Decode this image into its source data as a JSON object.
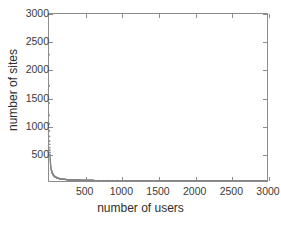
{
  "chart_data": {
    "type": "scatter",
    "title": "",
    "xlabel": "number of users",
    "ylabel": "number of sites",
    "xlim": [
      0,
      3000
    ],
    "ylim": [
      0,
      3000
    ],
    "xticks": [
      500,
      1000,
      1500,
      2000,
      2500,
      3000
    ],
    "yticks": [
      500,
      1000,
      1500,
      2000,
      2500,
      3000
    ],
    "xticklabels": [
      "500",
      "1000",
      "1500",
      "2000",
      "2500",
      "3000"
    ],
    "yticklabels": [
      "500",
      "1000",
      "1500",
      "2000",
      "2500",
      "3000"
    ],
    "grid": false,
    "legend": null,
    "marker": "dot",
    "marker_color": "#8a8a8a",
    "axis_color": "#8d8d8d",
    "text_color": "#2e2e2e",
    "x": [
      1,
      2,
      3,
      4,
      5,
      6,
      7,
      8,
      9,
      10,
      11,
      12,
      13,
      14,
      15,
      16,
      17,
      18,
      19,
      20,
      22,
      24,
      26,
      28,
      30,
      33,
      36,
      39,
      42,
      46,
      50,
      55,
      60,
      65,
      70,
      76,
      82,
      89,
      96,
      104,
      112,
      121,
      131,
      141,
      152,
      164,
      177,
      191,
      206,
      222,
      240,
      259,
      279,
      301,
      325,
      350,
      378,
      408,
      440,
      475,
      512,
      553,
      596,
      643,
      694,
      749,
      808,
      872,
      941,
      1015,
      1095,
      1181,
      1274,
      1375,
      1483,
      1600,
      1726,
      1862,
      2009,
      2167,
      2338,
      2522,
      2720,
      2935,
      3000
    ],
    "y": [
      2270,
      1710,
      1400,
      1180,
      1030,
      900,
      800,
      720,
      660,
      600,
      555,
      515,
      480,
      450,
      425,
      400,
      378,
      358,
      340,
      324,
      296,
      272,
      252,
      234,
      218,
      198,
      182,
      168,
      156,
      143,
      131,
      119,
      109,
      100,
      93,
      85,
      78,
      72,
      66,
      61,
      56,
      52,
      48,
      44,
      41,
      38,
      35,
      32,
      30,
      28,
      26,
      24,
      22,
      20,
      19,
      17,
      16,
      15,
      14,
      13,
      12,
      11,
      10,
      9,
      8,
      8,
      7,
      6,
      6,
      5,
      5,
      4,
      4,
      4,
      3,
      3,
      3,
      2,
      2,
      2,
      2,
      1,
      1,
      1,
      1
    ]
  },
  "axes": {
    "x_title": "number of users",
    "y_title": "number of sites"
  }
}
